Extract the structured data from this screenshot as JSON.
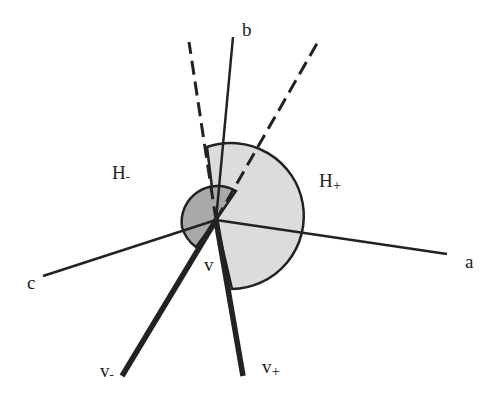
{
  "diagram": {
    "vertex": {
      "label": "v",
      "x": 216,
      "y": 220
    },
    "labels": {
      "b": "b",
      "a": "a",
      "c": "c",
      "h_minus": "H",
      "h_minus_sub": "-",
      "h_plus": "H",
      "h_plus_sub": "+",
      "v": "v",
      "v_minus": "v",
      "v_minus_sub": "-",
      "v_plus": "v",
      "v_plus_sub": "+"
    },
    "colors": {
      "stroke": "#222222",
      "light_sector": "#dcdcdc",
      "dark_sector": "#a9a9a9",
      "background": "#ffffff"
    }
  }
}
